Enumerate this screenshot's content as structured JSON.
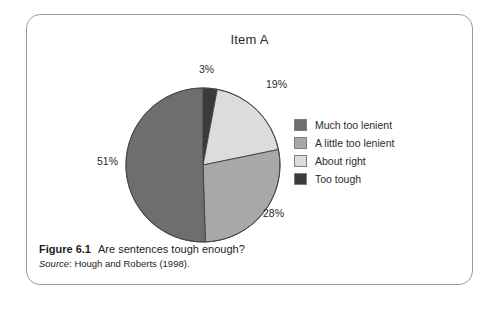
{
  "figure": {
    "title": "Item A",
    "caption_figure_number": "Figure 6.1",
    "caption_text": "Are sentences tough enough?",
    "source_word": "Source",
    "source_text": ": Hough and Roberts (1998)."
  },
  "chart_data": {
    "type": "pie",
    "title": "Item A",
    "categories": [
      "Much too lenient",
      "A little too lenient",
      "About right",
      "Too tough"
    ],
    "values": [
      51,
      28,
      19,
      3
    ],
    "value_labels": [
      "51%",
      "28%",
      "19%",
      "3%"
    ],
    "colors": [
      "#6e6e6e",
      "#a8a8a8",
      "#dcdcdc",
      "#3a3a3a"
    ],
    "unit": "percent",
    "legend_position": "right",
    "start_angle_deg": 0,
    "direction": "clockwise",
    "draw_order": [
      {
        "name": "Too tough",
        "value": 3,
        "label": "3%",
        "color": "#3a3a3a"
      },
      {
        "name": "About right",
        "value": 19,
        "label": "19%",
        "color": "#dcdcdc"
      },
      {
        "name": "A little too lenient",
        "value": 28,
        "label": "28%",
        "color": "#a8a8a8"
      },
      {
        "name": "Much too lenient",
        "value": 51,
        "label": "51%",
        "color": "#6e6e6e"
      }
    ]
  },
  "legend": {
    "items": [
      {
        "label": "Much too lenient",
        "color": "#6e6e6e"
      },
      {
        "label": "A little too lenient",
        "color": "#a8a8a8"
      },
      {
        "label": "About right",
        "color": "#dcdcdc"
      },
      {
        "label": "Too tough",
        "color": "#3a3a3a"
      }
    ]
  },
  "percent_labels": [
    "3%",
    "19%",
    "28%",
    "51%"
  ],
  "style": {
    "frame_border_color": "#9a9a9a",
    "background": "#ffffff",
    "text_color": "#2b2b2b"
  }
}
